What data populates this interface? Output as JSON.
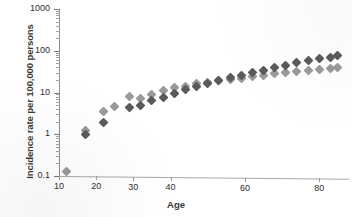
{
  "chart_data": {
    "type": "scatter",
    "title": "",
    "xlabel": "Age",
    "ylabel": "Incidence rate per 100,000 persons",
    "yscale": "log",
    "xscale": "linear",
    "xlim": [
      10,
      88
    ],
    "ylim": [
      0.1,
      1000
    ],
    "grid": false,
    "legend": "none",
    "xticks": [
      10,
      20,
      30,
      40,
      60,
      80
    ],
    "xtick_labels": [
      "10",
      "20",
      "30",
      "40",
      "60",
      "80"
    ],
    "yticks": [
      0.1,
      1,
      10,
      100,
      1000
    ],
    "ytick_labels": [
      "0.1",
      "1",
      "10",
      "100",
      "1000"
    ],
    "series": [
      {
        "name": "series-light",
        "color": "#9a9a9a",
        "marker": "diamond",
        "points": [
          {
            "x": 12,
            "y": 0.13
          },
          {
            "x": 17,
            "y": 1.25
          },
          {
            "x": 22,
            "y": 3.6
          },
          {
            "x": 25,
            "y": 4.6
          },
          {
            "x": 29,
            "y": 8.0
          },
          {
            "x": 32,
            "y": 7.2
          },
          {
            "x": 35,
            "y": 9.0
          },
          {
            "x": 38,
            "y": 11.0
          },
          {
            "x": 41,
            "y": 13.0
          },
          {
            "x": 44,
            "y": 14.0
          },
          {
            "x": 47,
            "y": 16.0
          },
          {
            "x": 50,
            "y": 17.5
          },
          {
            "x": 53,
            "y": 19.0
          },
          {
            "x": 56,
            "y": 20.0
          },
          {
            "x": 59,
            "y": 22.0
          },
          {
            "x": 62,
            "y": 24.0
          },
          {
            "x": 65,
            "y": 26.0
          },
          {
            "x": 68,
            "y": 28.0
          },
          {
            "x": 71,
            "y": 30.0
          },
          {
            "x": 74,
            "y": 32.0
          },
          {
            "x": 77,
            "y": 34.0
          },
          {
            "x": 80,
            "y": 36.0
          },
          {
            "x": 83,
            "y": 38.0
          },
          {
            "x": 85,
            "y": 40.0
          }
        ]
      },
      {
        "name": "series-dark",
        "color": "#5a5a5a",
        "marker": "diamond",
        "points": [
          {
            "x": 17,
            "y": 1.0
          },
          {
            "x": 22,
            "y": 1.9
          },
          {
            "x": 29,
            "y": 4.3
          },
          {
            "x": 32,
            "y": 5.0
          },
          {
            "x": 35,
            "y": 6.4
          },
          {
            "x": 38,
            "y": 7.4
          },
          {
            "x": 41,
            "y": 9.5
          },
          {
            "x": 44,
            "y": 11.5
          },
          {
            "x": 47,
            "y": 14.0
          },
          {
            "x": 50,
            "y": 16.5
          },
          {
            "x": 53,
            "y": 19.5
          },
          {
            "x": 56,
            "y": 22.5
          },
          {
            "x": 59,
            "y": 26.0
          },
          {
            "x": 62,
            "y": 30.0
          },
          {
            "x": 65,
            "y": 34.0
          },
          {
            "x": 68,
            "y": 39.0
          },
          {
            "x": 71,
            "y": 45.0
          },
          {
            "x": 74,
            "y": 52.0
          },
          {
            "x": 77,
            "y": 58.0
          },
          {
            "x": 80,
            "y": 64.0
          },
          {
            "x": 83,
            "y": 70.0
          },
          {
            "x": 85,
            "y": 76.0
          }
        ]
      }
    ]
  },
  "axes_geometry": {
    "plot_left_px": 59,
    "plot_right_px": 349,
    "plot_top_px": 9,
    "plot_bottom_px": 176
  }
}
